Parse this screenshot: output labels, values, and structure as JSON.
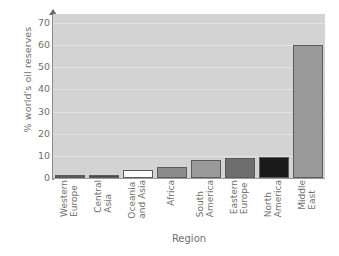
{
  "chart_data": {
    "type": "bar",
    "title": "",
    "xlabel": "Region",
    "ylabel": "% world's oil reserves",
    "categories": [
      "Western Europe",
      "Central Asia",
      "Oceania and Asia",
      "Africa",
      "South America",
      "Eastern Europe",
      "North America",
      "Middle East"
    ],
    "category_lines": [
      [
        "Western",
        "Europe"
      ],
      [
        "Central",
        "Asia"
      ],
      [
        "Oceania",
        "and Asia"
      ],
      [
        "Africa",
        ""
      ],
      [
        "South",
        "America"
      ],
      [
        "Eastern",
        "Europe"
      ],
      [
        "North",
        "America"
      ],
      [
        "Middle",
        "East"
      ]
    ],
    "values": [
      1,
      1.5,
      3.5,
      5,
      8,
      9,
      9.5,
      60
    ],
    "bar_colors": [
      "#5a5a5a",
      "#4a4a4a",
      "#fbfbfb",
      "#8c8c8c",
      "#9a9a9a",
      "#6e6e6e",
      "#1a1a1a",
      "#9a9a9a"
    ],
    "bar_edge_color": "#5b5b5b",
    "ylim": [
      0,
      74
    ],
    "yticks": [
      0,
      10,
      20,
      30,
      40,
      50,
      60,
      70
    ],
    "ytick_labels": [
      "0",
      "10",
      "20",
      "30",
      "40",
      "50",
      "60",
      "70"
    ],
    "grid": true,
    "grid_color": "#e4e4e4",
    "plot_background": "#d3d3d3",
    "figure_background": "#ffffff",
    "legend": null,
    "text_color": "#6f6f6f"
  }
}
